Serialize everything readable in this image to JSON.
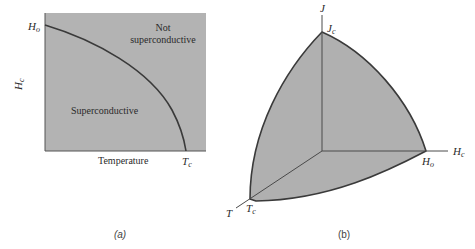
{
  "colors": {
    "region_fill": "#b3b3b3",
    "curve_stroke": "#3a3a3a",
    "axis_stroke": "#4a4a4a",
    "background": "#ffffff"
  },
  "panel_a": {
    "caption": "(a)",
    "y_axis_label": "H",
    "y_axis_label_sub": "c",
    "y_top_label": "H",
    "y_top_label_sub": "o",
    "x_axis_label": "Temperature",
    "x_end_label": "T",
    "x_end_label_sub": "c",
    "region_outside_line1": "Not",
    "region_outside_line2": "superconductive",
    "region_inside": "Superconductive"
  },
  "panel_b": {
    "caption": "(b)",
    "axis_j": "J",
    "axis_j_point": "J",
    "axis_j_point_sub": "c",
    "axis_h": "H",
    "axis_h_sub": "c",
    "axis_h_point": "H",
    "axis_h_point_sub": "o",
    "axis_t": "T",
    "axis_t_point": "T",
    "axis_t_point_sub": "c"
  }
}
